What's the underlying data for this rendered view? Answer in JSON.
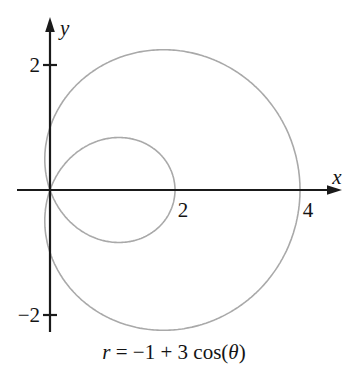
{
  "figure": {
    "background": "#ffffff"
  },
  "chart_data": {
    "type": "line",
    "plot_kind": "polar_curve",
    "equation_text": "r = −1 + 3 cos(θ)",
    "equation_parts": [
      {
        "text": "r",
        "italic": true
      },
      {
        "text": " = −1 + 3 cos(",
        "italic": false
      },
      {
        "text": "θ",
        "italic": true
      },
      {
        "text": ")",
        "italic": false
      }
    ],
    "polar_params": {
      "a": -1,
      "b": 3,
      "theta_range_deg": [
        0,
        360
      ]
    },
    "xlabel": "x",
    "ylabel": "y",
    "x_ticks": [
      {
        "value": 2,
        "label": "2"
      },
      {
        "value": 4,
        "label": "4"
      }
    ],
    "y_ticks": [
      {
        "value": 2,
        "label": "2"
      },
      {
        "value": -2,
        "label": "−2"
      }
    ],
    "x_intercepts": [
      0,
      2,
      4
    ],
    "ylim": [
      -2.25,
      2.25
    ],
    "xlim": [
      0,
      4
    ],
    "grid": false,
    "legend": false,
    "axis_color": "#1a1a1a",
    "curve_color": "#a9a9a9"
  }
}
